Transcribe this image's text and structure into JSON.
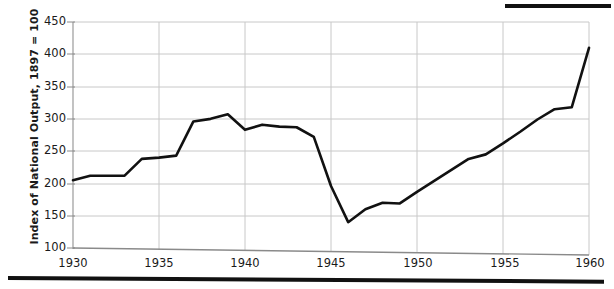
{
  "chart_data": {
    "type": "line",
    "title": "",
    "xlabel": "",
    "ylabel": "Index of National Output, 1897 = 100",
    "xlim": [
      1930,
      1960
    ],
    "ylim": [
      100,
      450
    ],
    "ytick_labels": [
      "450",
      "400",
      "350",
      "300",
      "250",
      "200",
      "150",
      "100"
    ],
    "ytick_values": [
      450,
      400,
      350,
      300,
      250,
      200,
      150,
      100
    ],
    "xtick_labels": [
      "1930",
      "1935",
      "1940",
      "1945",
      "1950",
      "1955",
      "1960"
    ],
    "xtick_values": [
      1930,
      1935,
      1940,
      1945,
      1950,
      1955,
      1960
    ],
    "grid": true,
    "legend": "none",
    "line_color": "#111111",
    "grid_color": "#c8c8c8",
    "x": [
      1930,
      1931,
      1932,
      1933,
      1934,
      1935,
      1936,
      1937,
      1938,
      1939,
      1940,
      1941,
      1942,
      1943,
      1944,
      1945,
      1946,
      1947,
      1948,
      1949,
      1950,
      1951,
      1952,
      1953,
      1954,
      1955,
      1956,
      1957,
      1958,
      1959,
      1960
    ],
    "values": [
      205,
      212,
      212,
      212,
      238,
      240,
      243,
      296,
      300,
      307,
      283,
      291,
      288,
      287,
      272,
      196,
      140,
      160,
      170,
      169,
      187,
      204,
      221,
      238,
      245,
      262,
      280,
      299,
      315,
      318,
      410
    ],
    "series": [
      {
        "name": "Index of National Output",
        "values": [
          205,
          212,
          212,
          212,
          238,
          240,
          243,
          296,
          300,
          307,
          283,
          291,
          288,
          287,
          272,
          196,
          140,
          160,
          170,
          169,
          187,
          204,
          221,
          238,
          245,
          262,
          280,
          299,
          315,
          318,
          410
        ]
      }
    ]
  }
}
